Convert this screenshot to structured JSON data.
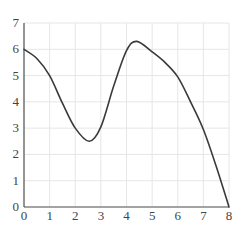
{
  "chart_data": {
    "type": "line",
    "title": "",
    "xlabel": "",
    "ylabel": "",
    "xlim": [
      0,
      8
    ],
    "ylim": [
      0,
      7
    ],
    "grid": true,
    "legend": null,
    "x_ticks": [
      "0",
      "1",
      "2",
      "3",
      "4",
      "5",
      "6",
      "7",
      "8"
    ],
    "y_ticks": [
      "0",
      "1",
      "2",
      "3",
      "4",
      "5",
      "6",
      "7"
    ],
    "series": [
      {
        "name": "curve",
        "x": [
          0,
          0.5,
          1,
          1.5,
          2,
          2.55,
          3,
          3.5,
          4,
          4.4,
          5,
          5.5,
          6,
          6.5,
          7,
          7.5,
          8
        ],
        "y": [
          6.0,
          5.65,
          5.0,
          3.95,
          3.0,
          2.5,
          3.05,
          4.6,
          5.95,
          6.3,
          5.9,
          5.5,
          4.95,
          4.0,
          2.95,
          1.55,
          0.0
        ]
      }
    ]
  },
  "colors": {
    "line": "#3a3a3a",
    "axis": "#555555",
    "grid": "#e6e6e6",
    "label": "#444444"
  }
}
